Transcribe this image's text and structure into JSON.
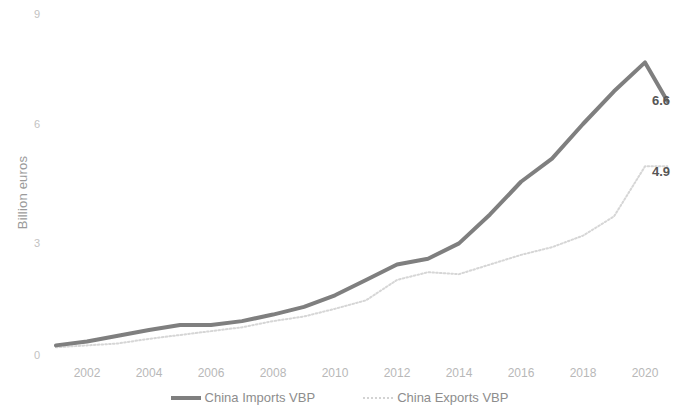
{
  "chart_data": {
    "type": "line",
    "title": "",
    "xlabel": "",
    "ylabel": "Billion euros",
    "ylim": [
      0,
      9
    ],
    "y_ticks": [
      "0",
      "3",
      "6",
      "9"
    ],
    "y_tick_values": [
      0,
      3,
      6,
      9
    ],
    "grid": false,
    "legend_position": "bottom",
    "x": [
      2001,
      2002,
      2003,
      2004,
      2005,
      2006,
      2007,
      2008,
      2009,
      2010,
      2011,
      2012,
      2013,
      2014,
      2015,
      2016,
      2017,
      2018,
      2019,
      2020
    ],
    "x_tick_labels": [
      "2002",
      "2004",
      "2006",
      "2008",
      "2010",
      "2012",
      "2014",
      "2016",
      "2018",
      "2020"
    ],
    "x_tick_values": [
      2002,
      2004,
      2006,
      2008,
      2010,
      2012,
      2014,
      2016,
      2018,
      2020
    ],
    "xlim": [
      2001,
      2020
    ],
    "series": [
      {
        "name": "China Imports VBP",
        "color": "#7f7f7f",
        "style": "solid",
        "width": 4,
        "values": [
          0.25,
          0.35,
          0.5,
          0.65,
          0.78,
          0.78,
          0.88,
          1.05,
          1.25,
          1.55,
          1.95,
          2.35,
          2.5,
          2.9,
          3.65,
          4.5,
          5.1,
          6.0,
          6.85,
          7.6
        ],
        "end_label": "6.6",
        "end_label_value": 6.6
      },
      {
        "name": "China Exports VBP",
        "color": "#d6d6d6",
        "style": "dotted",
        "width": 2,
        "values": [
          0.2,
          0.25,
          0.3,
          0.42,
          0.52,
          0.62,
          0.72,
          0.88,
          1.0,
          1.2,
          1.42,
          1.95,
          2.15,
          2.1,
          2.35,
          2.6,
          2.8,
          3.1,
          3.6,
          4.9
        ],
        "end_label": "4.9",
        "end_label_value": 4.9
      }
    ],
    "annotations": [
      {
        "text": "6.6",
        "series": "China Imports VBP",
        "x": 2020,
        "y": 6.6
      },
      {
        "text": "4.9",
        "series": "China Exports VBP",
        "x": 2020,
        "y": 4.9
      }
    ]
  },
  "axis": {
    "y_title": "Billion euros",
    "y_ticks": [
      "9",
      "6",
      "3",
      "0"
    ],
    "x_ticks": [
      "2002",
      "2004",
      "2006",
      "2008",
      "2010",
      "2012",
      "2014",
      "2016",
      "2018",
      "2020"
    ]
  },
  "labels": {
    "imports_end": "6.6",
    "exports_end": "4.9"
  },
  "legend": {
    "items": [
      {
        "label": "China Imports VBP"
      },
      {
        "label": "China Exports VBP"
      }
    ]
  },
  "colors": {
    "imports_line": "#7f7f7f",
    "exports_line": "#d6d6d6",
    "tick_text": "#b8b8b8",
    "axis_title": "#9a9a9a",
    "data_label": "#565656"
  }
}
